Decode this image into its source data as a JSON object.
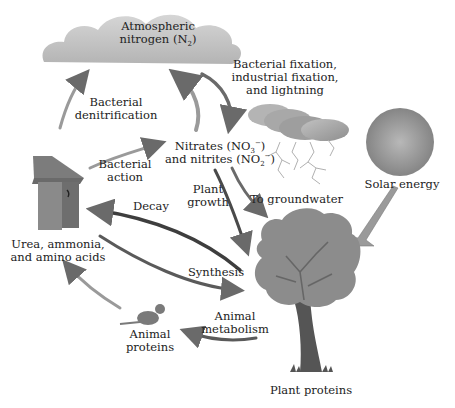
{
  "diagram": {
    "palette": {
      "background": "#ffffff",
      "cloud": "#c4c4c4",
      "storm_cloud": "#a8a8a8",
      "sun": "#9a9a9a",
      "tree_canopy": "#8c8c8c",
      "tree_trunk": "#5a5a5a",
      "arrow_dark": "#3a3a3a",
      "arrow_light": "#d8d8d8",
      "text": "#222222"
    },
    "nodes": {
      "atmosphere": {
        "line1": "Atmospheric",
        "line2_pre": "nitrogen (N",
        "line2_sub": "2",
        "line2_post": ")",
        "icon": "cloud-icon"
      },
      "fixation": {
        "line1": "Bacterial fixation,",
        "line2": "industrial fixation,",
        "line3": "and lightning",
        "icon": "storm-cloud-icon"
      },
      "nitrates": {
        "line1_pre": "Nitrates (NO",
        "line1_sub": "3",
        "line1_sup": "−",
        "line1_post": ")",
        "line2_pre": "and nitrites (NO",
        "line2_sub": "2",
        "line2_sup": "−",
        "line2_post": ")"
      },
      "solar": {
        "label": "Solar energy",
        "icon": "sun-icon"
      },
      "urea": {
        "line1": "Urea, ammonia,",
        "line2": "and amino acids",
        "icon": "outhouse-icon"
      },
      "animal_proteins": {
        "line1": "Animal",
        "line2": "proteins",
        "icon": "animal-icon"
      },
      "plant_proteins": {
        "label": "Plant proteins",
        "icon": "tree-icon"
      }
    },
    "processes": {
      "denitrification": {
        "line1": "Bacterial",
        "line2": "denitrification"
      },
      "bacterial_action": {
        "line1": "Bacterial",
        "line2": "action"
      },
      "plant_growth": {
        "line1": "Plant",
        "line2": "growth"
      },
      "groundwater": {
        "label": "To groundwater"
      },
      "decay": {
        "label": "Decay"
      },
      "synthesis": {
        "label": "Synthesis"
      },
      "animal_metabolism": {
        "line1": "Animal",
        "line2": "metabolism"
      }
    }
  }
}
